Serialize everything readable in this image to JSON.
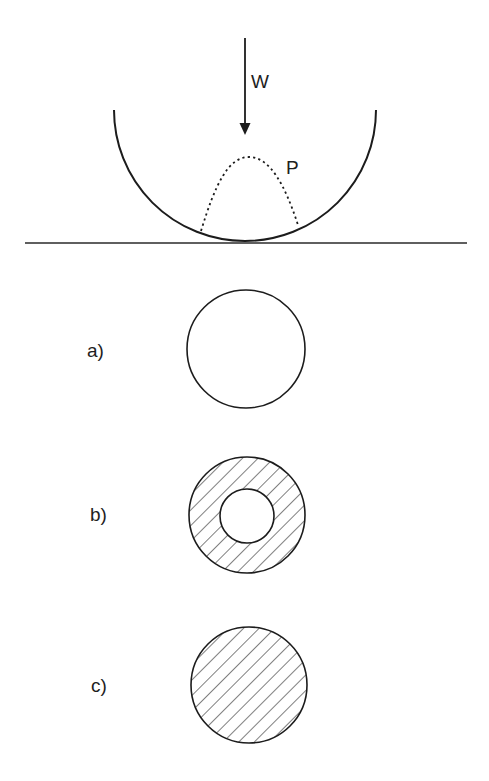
{
  "diagram": {
    "title": "",
    "colors": {
      "background": "#ffffff",
      "line": "#1c1c1c",
      "hatch": "#3a3a3a",
      "text": "#1e1e1e"
    },
    "contact_figure": {
      "load_label": "W",
      "pressure_label": "P",
      "cylinder": {
        "cx": 245,
        "cy": 110,
        "r": 131
      },
      "ground_line": {
        "x1": 25,
        "x2": 467,
        "y": 243
      },
      "load_arrow": {
        "x": 245,
        "y_start": 38,
        "y_end": 135
      },
      "pressure_curve": {
        "left": [
          201,
          231
        ],
        "peak": [
          249,
          157
        ],
        "right": [
          298,
          225
        ],
        "style": "dotted"
      }
    },
    "cross_sections": [
      {
        "label": "a)",
        "type": "solid-empty",
        "cx": 246,
        "cy": 349,
        "r": 59
      },
      {
        "label": "b)",
        "type": "hollow-hatched",
        "cx": 247,
        "cy": 515,
        "r": 58,
        "inner_r": 27
      },
      {
        "label": "c)",
        "type": "solid-hatched",
        "cx": 249,
        "cy": 685,
        "r": 58
      }
    ]
  }
}
